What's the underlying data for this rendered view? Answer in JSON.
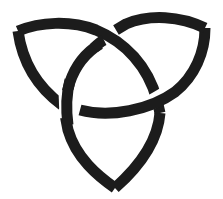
{
  "image": {
    "title": "Triquetra",
    "description": "Celtic triquetra knot symbol with three interlaced pointed loops",
    "icon": "triquetra-icon"
  },
  "colors": {
    "background": "#ffffff",
    "stroke": "#1c1c1c",
    "gap": "#ffffff"
  },
  "geometry": {
    "width": 223,
    "height": 199,
    "stroke_width": 11,
    "gap_width": 16,
    "tips": {
      "top_left": [
        16,
        31
      ],
      "top_right": [
        207,
        27
      ],
      "bottom": [
        115,
        192
      ]
    }
  }
}
